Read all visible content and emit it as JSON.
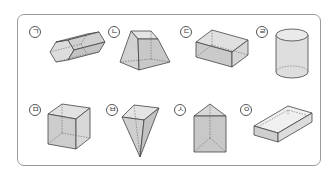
{
  "figure": {
    "items": [
      {
        "label": "ㄱ",
        "shape": "hexagonal-prism"
      },
      {
        "label": "ㄴ",
        "shape": "square-frustum"
      },
      {
        "label": "ㄷ",
        "shape": "rectangular-prism"
      },
      {
        "label": "ㄹ",
        "shape": "cylinder"
      },
      {
        "label": "ㅁ",
        "shape": "cube"
      },
      {
        "label": "ㅂ",
        "shape": "square-pyramid-inverted"
      },
      {
        "label": "ㅅ",
        "shape": "triangular-prism"
      },
      {
        "label": "ㅇ",
        "shape": "open-box"
      }
    ]
  },
  "colors": {
    "fill_light": "#e6e6e6",
    "fill_mid": "#d2d2d2",
    "fill_dark": "#bdbdbd",
    "stroke": "#444444",
    "frame": "#9a9a9a"
  }
}
